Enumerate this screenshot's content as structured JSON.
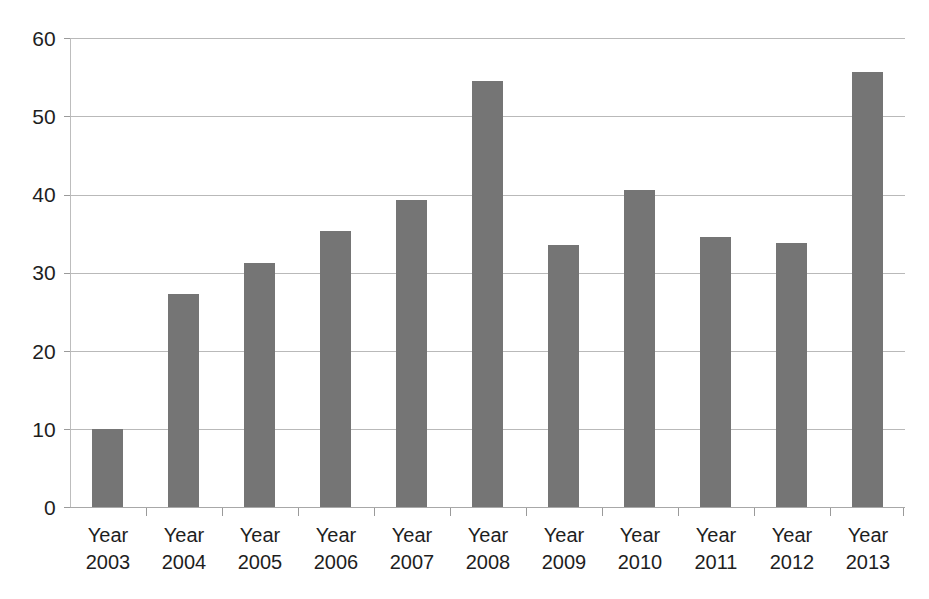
{
  "chart_data": {
    "type": "bar",
    "title": "",
    "subtitle": "",
    "xlabel": "",
    "ylabel": "",
    "categories": [
      "Year 2003",
      "Year 2004",
      "Year 2005",
      "Year 2006",
      "Year 2007",
      "Year 2008",
      "Year 2009",
      "Year 2010",
      "Year 2011",
      "Year 2012",
      "Year 2013"
    ],
    "category_lines": [
      [
        "Year",
        "2003"
      ],
      [
        "Year",
        "2004"
      ],
      [
        "Year",
        "2005"
      ],
      [
        "Year",
        "2006"
      ],
      [
        "Year",
        "2007"
      ],
      [
        "Year",
        "2008"
      ],
      [
        "Year",
        "2009"
      ],
      [
        "Year",
        "2010"
      ],
      [
        "Year",
        "2011"
      ],
      [
        "Year",
        "2012"
      ],
      [
        "Year",
        "2013"
      ]
    ],
    "values": [
      10.0,
      27.2,
      31.2,
      35.3,
      39.3,
      54.5,
      33.5,
      40.5,
      34.6,
      33.8,
      55.7
    ],
    "ylim": [
      0,
      60
    ],
    "yticks": [
      0,
      10,
      20,
      30,
      40,
      50,
      60
    ],
    "ytick_labels": [
      "0",
      "10",
      "20",
      "30",
      "40",
      "50",
      "60"
    ],
    "grid": true,
    "grid_axis": "y",
    "legend": false,
    "legend_position": "none",
    "bar_color": "#757575",
    "gridline_color": "#b9b9b9",
    "axis_color": "#9a9a9a",
    "background_color": "#ffffff",
    "series": [
      {
        "name": "",
        "values": [
          10.0,
          27.2,
          31.2,
          35.3,
          39.3,
          54.5,
          33.5,
          40.5,
          34.6,
          33.8,
          55.7
        ]
      }
    ]
  }
}
